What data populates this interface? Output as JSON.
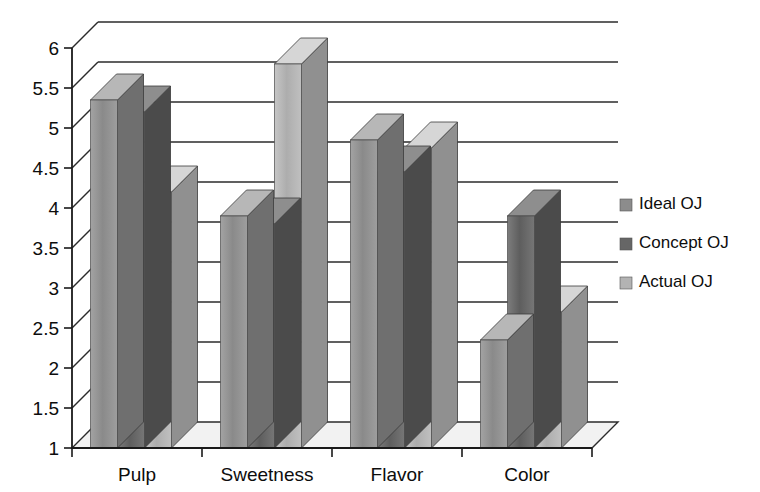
{
  "chart_data": {
    "type": "bar",
    "title": "",
    "subtitle": "",
    "xlabel": "",
    "ylabel": "",
    "categories": [
      "Pulp",
      "Sweetness",
      "Flavor",
      "Color"
    ],
    "series": [
      {
        "name": "Ideal OJ",
        "color": "#8c8c8c",
        "values": [
          5.35,
          3.9,
          4.85,
          2.35
        ]
      },
      {
        "name": "Concept OJ",
        "color": "#666666",
        "values": [
          5.2,
          3.8,
          4.45,
          3.9
        ]
      },
      {
        "name": "Actual OJ",
        "color": "#b3b3b3",
        "values": [
          4.2,
          5.8,
          4.75,
          2.7
        ]
      }
    ],
    "ylim": [
      1,
      6
    ],
    "ytick_step": 0.5,
    "ytick_labels": [
      "6",
      "5.5",
      "5",
      "4.5",
      "4",
      "3.5",
      "3",
      "2.5",
      "2",
      "1.5",
      "1"
    ],
    "ytick_values": [
      6,
      5.5,
      5,
      4.5,
      4,
      3.5,
      3,
      2.5,
      2,
      1.5,
      1
    ],
    "grid": true,
    "grid_axis": "y",
    "legend_position": "right",
    "style": "3d-column",
    "background_color": "#ffffff",
    "axis_color": "#1a1a1a",
    "grid_color": "#2b2b2b"
  },
  "legend": {
    "items": [
      {
        "label": "Ideal OJ",
        "swatch_color": "#8c8c8c"
      },
      {
        "label": "Concept OJ",
        "swatch_color": "#666666"
      },
      {
        "label": "Actual OJ",
        "swatch_color": "#b3b3b3"
      }
    ]
  }
}
